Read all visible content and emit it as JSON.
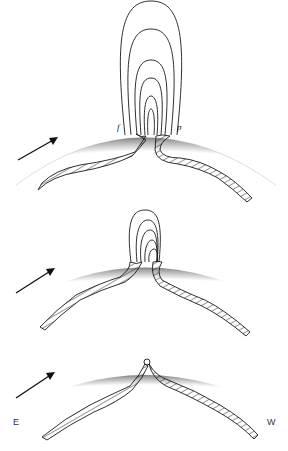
{
  "figure": {
    "panels": [
      {
        "id": "top",
        "stage": "large loop system",
        "loop_count": 6,
        "labels": {
          "following": "f",
          "preceding": "p"
        }
      },
      {
        "id": "middle",
        "stage": "smaller loop system",
        "loop_count": 5
      },
      {
        "id": "bottom",
        "stage": "flux submerged, small ring at apex",
        "loop_count": 0,
        "labels": {
          "east": "E",
          "west": "W"
        }
      }
    ],
    "arrow": "rotation direction (east to west)",
    "colors": {
      "ink": "#1a1a1a",
      "limb_dark": "#8a8a8a",
      "limb_light": "#ffffff"
    }
  }
}
